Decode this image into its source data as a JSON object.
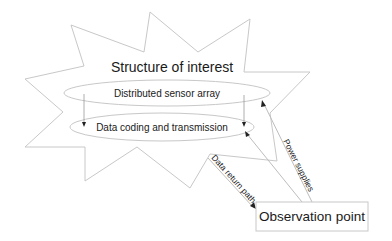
{
  "diagram": {
    "structure": {
      "title": "Structure of interest",
      "shape": "star"
    },
    "nodes": {
      "sensor_array": {
        "label": "Distributed sensor array",
        "shape": "ellipse"
      },
      "data_coding": {
        "label": "Data coding and transmission",
        "shape": "ellipse"
      },
      "observation_point": {
        "label": "Observation point",
        "shape": "rectangle"
      }
    },
    "edges": {
      "data_return": {
        "label": "Data return path",
        "from": "data_coding",
        "to": "observation_point"
      },
      "power_supplies": {
        "label": "Power supplies",
        "from": "observation_point",
        "to": "sensor_array"
      },
      "power_to_coding": {
        "label": "",
        "from": "observation_point",
        "to": "data_coding"
      },
      "sensor_to_coding_left": {
        "label": "",
        "from": "sensor_array",
        "to": "data_coding"
      },
      "sensor_to_coding_right": {
        "label": "",
        "from": "sensor_array",
        "to": "data_coding"
      }
    },
    "colors": {
      "outline": "#c8c8c8",
      "text": "#1a1a1a",
      "arrowhead": "#222222"
    }
  }
}
